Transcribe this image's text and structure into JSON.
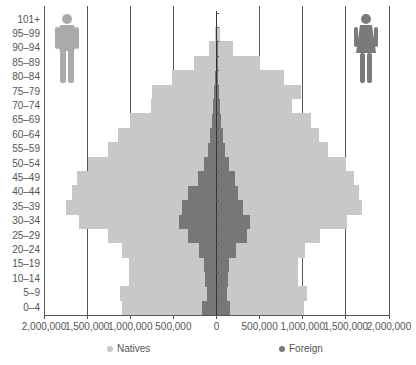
{
  "chart_data": {
    "type": "bar",
    "subtype": "population-pyramid",
    "title": "",
    "xlabel": "",
    "ylabel": "",
    "categories": [
      "0–4",
      "5–9",
      "10–14",
      "15–19",
      "20–24",
      "25–29",
      "30–34",
      "35–39",
      "40–44",
      "45–49",
      "50–54",
      "55–59",
      "60–64",
      "65–69",
      "70–74",
      "75–79",
      "80–84",
      "85–89",
      "90–94",
      "95–99",
      "101+"
    ],
    "series": [
      {
        "name": "Natives",
        "side": "male",
        "color": "#c8c8c8",
        "values": [
          1100000,
          1120000,
          1020000,
          1020000,
          1090000,
          1260000,
          1590000,
          1740000,
          1680000,
          1620000,
          1490000,
          1260000,
          1140000,
          1000000,
          760000,
          750000,
          515000,
          265000,
          90000,
          20000,
          0
        ]
      },
      {
        "name": "Natives",
        "side": "female",
        "color": "#c8c8c8",
        "values": [
          1010000,
          1050000,
          940000,
          940000,
          1030000,
          1200000,
          1510000,
          1690000,
          1650000,
          1590000,
          1500000,
          1290000,
          1190000,
          1090000,
          880000,
          980000,
          785000,
          500000,
          190000,
          45000,
          0
        ]
      },
      {
        "name": "Foreign",
        "side": "male",
        "color": "#777777",
        "values": [
          165000,
          115000,
          135000,
          150000,
          205000,
          330000,
          440000,
          395000,
          325000,
          220000,
          150000,
          100000,
          70000,
          55000,
          40000,
          30000,
          15000,
          8000,
          3000,
          0,
          0
        ]
      },
      {
        "name": "Foreign",
        "side": "female",
        "color": "#777777",
        "values": [
          155000,
          125000,
          130000,
          145000,
          225000,
          350000,
          385000,
          310000,
          250000,
          220000,
          150000,
          100000,
          70000,
          55000,
          40000,
          30000,
          15000,
          8000,
          3000,
          0,
          0
        ]
      }
    ],
    "xlim": [
      -2000000,
      2000000
    ],
    "xticks": [
      "2,000,000",
      "1,500,000",
      "1,000,000",
      "500,000",
      "0",
      "500,000",
      "1,000,000",
      "1,500,000",
      "2,000,000"
    ],
    "grid": true,
    "legend": {
      "position": "bottom",
      "entries": [
        "Natives",
        "Foreign"
      ]
    },
    "annotations": {
      "left_icon": "male-figure-icon",
      "right_icon": "female-figure-icon"
    }
  },
  "legend": {
    "natives": "Natives",
    "foreign": "Foreign"
  }
}
